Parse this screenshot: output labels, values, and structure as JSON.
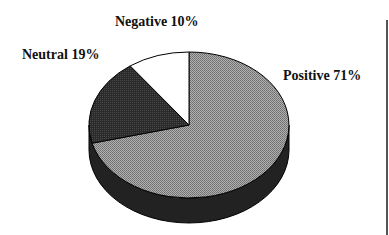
{
  "chart_data": {
    "type": "pie",
    "style": "3d",
    "title": "",
    "categories": [
      "Positive",
      "Neutral",
      "Negative"
    ],
    "values": [
      71,
      19,
      10
    ],
    "labels": [
      "Positive 71%",
      "Neutral 19%",
      "Negative 10%"
    ],
    "colors": {
      "Positive": "#9a9a9a",
      "Neutral": "#2a2a2a",
      "Negative": "#ffffff"
    },
    "legend": "none"
  }
}
